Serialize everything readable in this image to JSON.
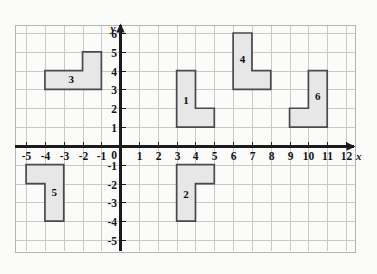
{
  "figure": {
    "kind": "coordinate-plane-with-polygons",
    "background_color": "#fbfbfa",
    "grid_color": "#c9c9c9",
    "axis_color": "#1b1b1b",
    "shape_fill": "#e7e7e7",
    "shape_stroke": "#4a4a4a"
  },
  "axes": {
    "x_label": "x",
    "y_label": "y",
    "origin_label": "0",
    "x_ticks": [
      -5,
      -4,
      -3,
      -2,
      -1,
      1,
      2,
      3,
      4,
      5,
      6,
      7,
      8,
      9,
      10,
      11,
      12
    ],
    "y_ticks": [
      6,
      5,
      4,
      3,
      2,
      1,
      -1,
      -2,
      -3,
      -4,
      -5
    ],
    "x_tick_labels": [
      "-5",
      "-4",
      "-3",
      "-2",
      "-1",
      "1",
      "2",
      "3",
      "4",
      "5",
      "6",
      "7",
      "8",
      "9",
      "10",
      "11",
      "12"
    ],
    "y_tick_labels": [
      "6",
      "5",
      "4",
      "3",
      "2",
      "1",
      "-1",
      "-2",
      "-3",
      "-4",
      "-5"
    ],
    "xlim": [
      -5.6,
      12.45
    ],
    "ylim": [
      -5.6,
      6.45
    ],
    "grid": true
  },
  "chart_data": {
    "type": "scatter",
    "title": "",
    "xlabel": "x",
    "ylabel": "y",
    "xlim": [
      -5.6,
      12.45
    ],
    "ylim": [
      -5.6,
      6.45
    ],
    "grid": true,
    "legend": "none",
    "shapes": [
      {
        "label": "1",
        "vertices": [
          [
            3,
            4
          ],
          [
            4,
            4
          ],
          [
            4,
            2
          ],
          [
            5,
            2
          ],
          [
            5,
            1
          ],
          [
            3,
            1
          ]
        ],
        "label_at": [
          3.5,
          2.35
        ]
      },
      {
        "label": "2",
        "vertices": [
          [
            3,
            -1
          ],
          [
            5,
            -1
          ],
          [
            5,
            -2
          ],
          [
            4,
            -2
          ],
          [
            4,
            -4
          ],
          [
            3,
            -4
          ]
        ],
        "label_at": [
          3.5,
          -2.65
        ]
      },
      {
        "label": "3",
        "vertices": [
          [
            -4,
            4
          ],
          [
            -2,
            4
          ],
          [
            -2,
            5
          ],
          [
            -1,
            5
          ],
          [
            -1,
            3
          ],
          [
            -4,
            3
          ]
        ],
        "label_at": [
          -2.6,
          3.5
        ]
      },
      {
        "label": "4",
        "vertices": [
          [
            6,
            6
          ],
          [
            7,
            6
          ],
          [
            7,
            4
          ],
          [
            8,
            4
          ],
          [
            8,
            3
          ],
          [
            6,
            3
          ]
        ],
        "label_at": [
          6.5,
          4.55
        ]
      },
      {
        "label": "5",
        "vertices": [
          [
            -5,
            -1
          ],
          [
            -3,
            -1
          ],
          [
            -3,
            -4
          ],
          [
            -4,
            -4
          ],
          [
            -4,
            -2
          ],
          [
            -5,
            -2
          ]
        ],
        "label_at": [
          -3.5,
          -2.55
        ]
      },
      {
        "label": "6",
        "vertices": [
          [
            10,
            4
          ],
          [
            11,
            4
          ],
          [
            11,
            1
          ],
          [
            9,
            1
          ],
          [
            9,
            2
          ],
          [
            10,
            2
          ]
        ],
        "label_at": [
          10.5,
          2.55
        ]
      }
    ]
  }
}
